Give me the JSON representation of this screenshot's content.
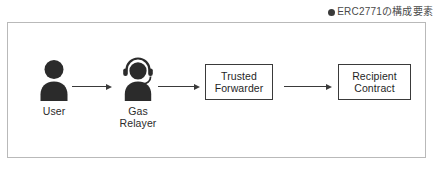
{
  "caption": {
    "bullet_icon": "bullet-dot-icon",
    "text": "ERC2771の構成要素"
  },
  "diagram": {
    "title": "ERC2771の構成要素",
    "nodes": [
      {
        "id": "user",
        "kind": "person",
        "icon": "person-icon",
        "label": "User"
      },
      {
        "id": "gas-relayer",
        "kind": "person",
        "icon": "person-headset-icon",
        "label": "Gas\nRelayer"
      },
      {
        "id": "trusted-forwarder",
        "kind": "box",
        "label": "Trusted\nForwarder"
      },
      {
        "id": "recipient-contract",
        "kind": "box",
        "label": "Recipient\nContract"
      }
    ],
    "arrows": [
      {
        "id": "arrow-user-to-relayer",
        "from": "user",
        "to": "gas-relayer"
      },
      {
        "id": "arrow-relayer-to-forwarder",
        "from": "gas-relayer",
        "to": "trusted-forwarder"
      },
      {
        "id": "arrow-forwarder-to-recipient",
        "from": "trusted-forwarder",
        "to": "recipient-contract"
      }
    ]
  },
  "colors": {
    "icon_fill": "#2b2b2b",
    "stroke": "#3a3a3a",
    "frame_border": "#b9b9b9",
    "caption_text": "#4a4a4a",
    "background": "#ffffff"
  }
}
